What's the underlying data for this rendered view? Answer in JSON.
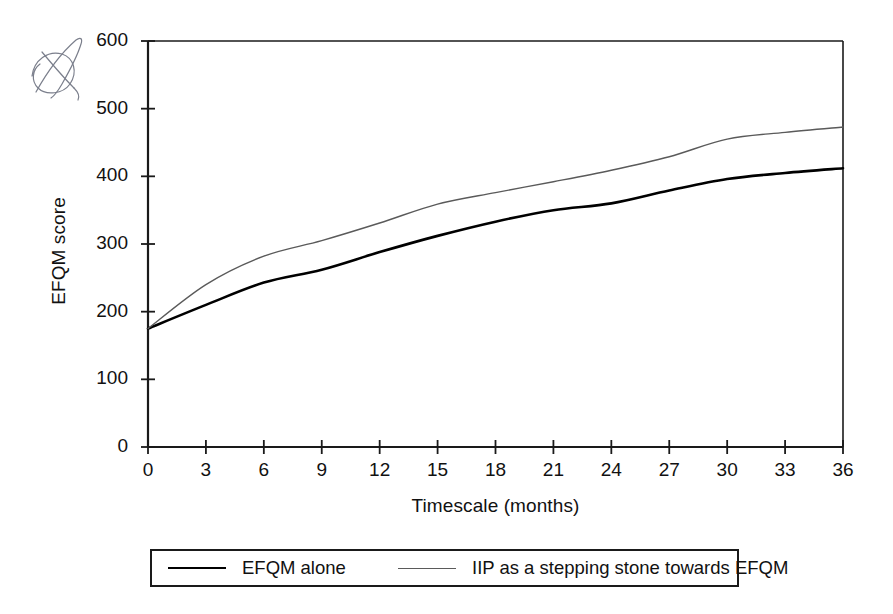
{
  "chart_data": {
    "type": "line",
    "title": "",
    "xlabel": "Timescale (months)",
    "ylabel": "EFQM score",
    "xlim": [
      0,
      36
    ],
    "ylim": [
      0,
      600
    ],
    "xticks": [
      "0",
      "3",
      "6",
      "9",
      "12",
      "15",
      "18",
      "21",
      "24",
      "27",
      "30",
      "33",
      "36"
    ],
    "yticks": [
      "0",
      "100",
      "200",
      "300",
      "400",
      "500",
      "600"
    ],
    "grid": false,
    "legend_position": "bottom",
    "x": [
      0,
      3,
      6,
      9,
      12,
      15,
      18,
      21,
      24,
      27,
      30,
      33,
      36
    ],
    "series": [
      {
        "name": "EFQM alone",
        "color": "#000000",
        "width": 2.6,
        "values": [
          175,
          210,
          243,
          262,
          288,
          312,
          333,
          350,
          360,
          379,
          396,
          405,
          412
        ]
      },
      {
        "name": "IIP as a stepping stone towards EFQM",
        "color": "#5a5a5a",
        "width": 1.4,
        "values": [
          175,
          240,
          282,
          305,
          331,
          359,
          376,
          392,
          409,
          429,
          455,
          465,
          473
        ]
      }
    ]
  },
  "legend": {
    "entries": [
      {
        "label": "EFQM alone",
        "style": "thick"
      },
      {
        "label": "IIP as a stepping stone towards EFQM",
        "style": "thin"
      }
    ]
  },
  "annotations": {
    "handwritten_mark": "handwritten-scribble"
  }
}
